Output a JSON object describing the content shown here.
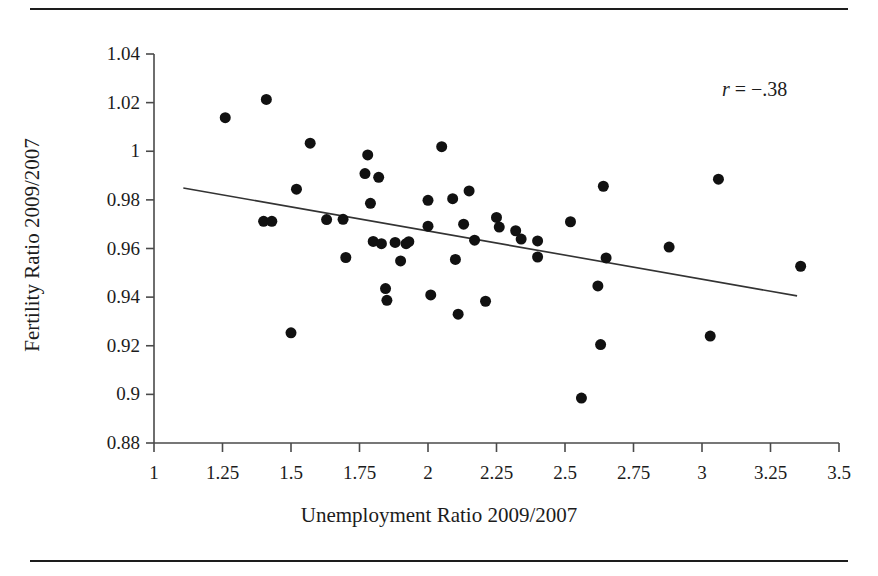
{
  "chart_data": {
    "type": "scatter",
    "title": "",
    "subtitle": "",
    "xlabel": "Unemployment Ratio 2009/2007",
    "ylabel": "Fertility Ratio 2009/2007",
    "xlim": [
      1,
      3.5
    ],
    "ylim": [
      0.88,
      1.04
    ],
    "xticks": [
      "1",
      "1.25",
      "1.5",
      "1.75",
      "2",
      "2.25",
      "2.5",
      "2.75",
      "3",
      "3.25",
      "3.5"
    ],
    "xtick_values": [
      1,
      1.25,
      1.5,
      1.75,
      2,
      2.25,
      2.5,
      2.75,
      3,
      3.25,
      3.5
    ],
    "yticks": [
      "0.88",
      "0.9",
      "0.92",
      "0.94",
      "0.96",
      "0.98",
      "1",
      "1.02",
      "1.04"
    ],
    "ytick_values": [
      0.88,
      0.9,
      0.92,
      0.94,
      0.96,
      0.98,
      1.0,
      1.02,
      1.04
    ],
    "grid": false,
    "legend": false,
    "legend_position": "none",
    "annotations": [
      {
        "name": "correlation",
        "text": "r = −.38",
        "symbol": "r",
        "relation": "=",
        "value": "−.38",
        "x": 3.07,
        "y": 1.026
      }
    ],
    "marker": {
      "shape": "circle",
      "color": "#111111",
      "size": 11
    },
    "trendline": {
      "type": "linear",
      "color": "#333333",
      "width": 1.6,
      "x_start": 1.107,
      "y_start": 0.9849,
      "x_end": 3.347,
      "y_end": 0.9405,
      "slope": -0.0198,
      "intercept": 1.0068
    },
    "points": [
      {
        "x": 1.26,
        "y": 1.0138
      },
      {
        "x": 1.41,
        "y": 1.0213
      },
      {
        "x": 1.4,
        "y": 0.9712
      },
      {
        "x": 1.43,
        "y": 0.9712
      },
      {
        "x": 1.5,
        "y": 0.9253
      },
      {
        "x": 1.52,
        "y": 0.9844
      },
      {
        "x": 1.57,
        "y": 1.0033
      },
      {
        "x": 1.63,
        "y": 0.9719
      },
      {
        "x": 1.69,
        "y": 0.972
      },
      {
        "x": 1.7,
        "y": 0.9563
      },
      {
        "x": 1.77,
        "y": 0.9908
      },
      {
        "x": 1.78,
        "y": 0.9985
      },
      {
        "x": 1.79,
        "y": 0.9786
      },
      {
        "x": 1.8,
        "y": 0.9629
      },
      {
        "x": 1.82,
        "y": 0.9893
      },
      {
        "x": 1.83,
        "y": 0.962
      },
      {
        "x": 1.845,
        "y": 0.9435
      },
      {
        "x": 1.85,
        "y": 0.9387
      },
      {
        "x": 1.88,
        "y": 0.9625
      },
      {
        "x": 1.9,
        "y": 0.9549
      },
      {
        "x": 1.92,
        "y": 0.962
      },
      {
        "x": 1.93,
        "y": 0.9628
      },
      {
        "x": 2.0,
        "y": 0.9798
      },
      {
        "x": 2.0,
        "y": 0.9692
      },
      {
        "x": 2.01,
        "y": 0.9409
      },
      {
        "x": 2.05,
        "y": 1.0019
      },
      {
        "x": 2.09,
        "y": 0.9805
      },
      {
        "x": 2.1,
        "y": 0.9555
      },
      {
        "x": 2.11,
        "y": 0.933
      },
      {
        "x": 2.13,
        "y": 0.97
      },
      {
        "x": 2.15,
        "y": 0.9837
      },
      {
        "x": 2.17,
        "y": 0.9634
      },
      {
        "x": 2.21,
        "y": 0.9383
      },
      {
        "x": 2.25,
        "y": 0.9728
      },
      {
        "x": 2.26,
        "y": 0.9688
      },
      {
        "x": 2.32,
        "y": 0.9673
      },
      {
        "x": 2.34,
        "y": 0.9639
      },
      {
        "x": 2.4,
        "y": 0.9631
      },
      {
        "x": 2.4,
        "y": 0.9565
      },
      {
        "x": 2.52,
        "y": 0.971
      },
      {
        "x": 2.56,
        "y": 0.8985
      },
      {
        "x": 2.62,
        "y": 0.9446
      },
      {
        "x": 2.63,
        "y": 0.9205
      },
      {
        "x": 2.64,
        "y": 0.9856
      },
      {
        "x": 2.65,
        "y": 0.9561
      },
      {
        "x": 2.88,
        "y": 0.9606
      },
      {
        "x": 3.03,
        "y": 0.924
      },
      {
        "x": 3.06,
        "y": 0.9885
      },
      {
        "x": 3.36,
        "y": 0.9527
      }
    ]
  },
  "figure": {
    "rule_color": "#1d1d1d"
  }
}
